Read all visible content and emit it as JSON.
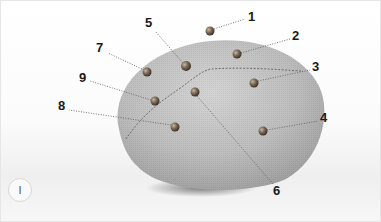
{
  "figure": {
    "badge": "I",
    "colors": {
      "fabric_light": "#c9c9c9",
      "fabric_dark": "#9a9a9a",
      "pin": "#7a6a58",
      "leader_line": "#555555",
      "label": "#1a1a1a"
    },
    "callouts": [
      {
        "label": "1",
        "pin": [
          209,
          30
        ],
        "text": [
          248,
          15
        ]
      },
      {
        "label": "2",
        "pin": [
          236,
          53
        ],
        "text": [
          292,
          34
        ]
      },
      {
        "label": "3",
        "pin": [
          253,
          82
        ],
        "text": [
          312,
          65
        ]
      },
      {
        "label": "4",
        "pin": [
          262,
          130
        ],
        "text": [
          320,
          116
        ]
      },
      {
        "label": "5",
        "pin": [
          185,
          65
        ],
        "text": [
          146,
          22
        ]
      },
      {
        "label": "6",
        "pin": [
          194,
          91
        ],
        "text": [
          274,
          190
        ]
      },
      {
        "label": "7",
        "pin": [
          146,
          71
        ],
        "text": [
          97,
          46
        ]
      },
      {
        "label": "8",
        "pin": [
          174,
          126
        ],
        "text": [
          58,
          105
        ]
      },
      {
        "label": "9",
        "pin": [
          154,
          100
        ],
        "text": [
          79,
          76
        ]
      }
    ]
  }
}
